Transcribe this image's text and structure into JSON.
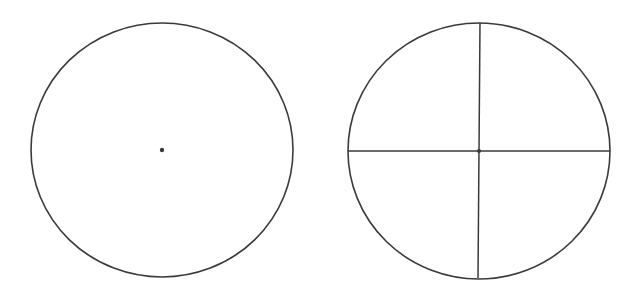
{
  "figure": {
    "background": "#ffffff",
    "stroke_color": "#3a3a3a",
    "circles": [
      {
        "name": "circle-with-center",
        "cx": 162,
        "cy": 150,
        "rx": 131,
        "ry": 127,
        "center_dot": {
          "r": 2.2
        }
      },
      {
        "name": "circle-with-diameters",
        "cx": 479,
        "cy": 151,
        "rx": 131,
        "ry": 128,
        "horizontal_diameter": {
          "x1": 348,
          "y1": 151,
          "x2": 610,
          "y2": 151
        },
        "vertical_diameter": {
          "x1": 480,
          "y1": 23,
          "x2": 478,
          "y2": 278
        },
        "center_dot": {
          "r": 2
        }
      }
    ]
  }
}
